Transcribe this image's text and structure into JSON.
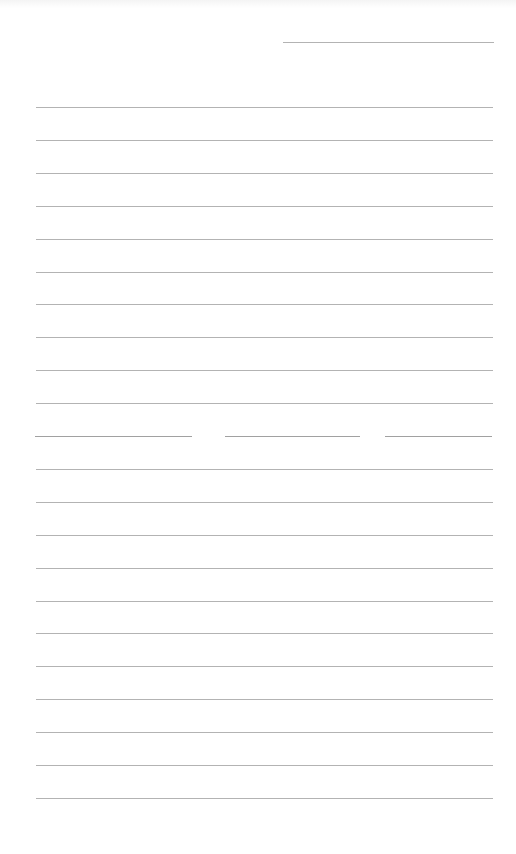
{
  "page": {
    "type": "lined-paper",
    "background": "#ffffff",
    "line_color": "#9a9a9a",
    "header_line": {
      "y": 42,
      "x_start": 283,
      "x_end": 494
    },
    "body_lines": {
      "x_start": 36,
      "x_end": 493,
      "first_y": 107,
      "spacing": 32.9,
      "count": 22
    },
    "broken_line": {
      "index": 10,
      "segments": [
        [
          35,
          192
        ],
        [
          225,
          360
        ],
        [
          385,
          492
        ]
      ]
    }
  }
}
